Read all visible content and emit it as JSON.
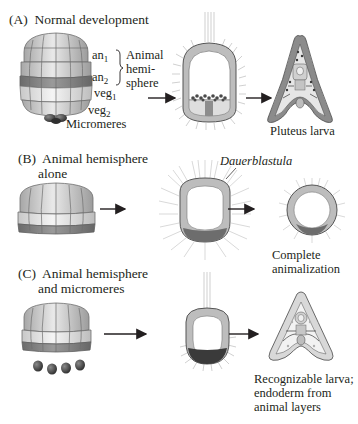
{
  "figure": {
    "panels": [
      {
        "id": "A",
        "title_letter": "(A)",
        "title": "Normal development",
        "tiers": {
          "an1": {
            "base": "an",
            "sub": "1"
          },
          "an2": {
            "base": "an",
            "sub": "2"
          },
          "veg1": {
            "base": "veg",
            "sub": "1"
          },
          "veg2": {
            "base": "veg",
            "sub": "2"
          },
          "micromeres": "Micromeres"
        },
        "bracket_label_lines": [
          "Animal",
          "hemi-",
          "sphere"
        ],
        "result_label": "Pluteus larva"
      },
      {
        "id": "B",
        "title_letter": "(B)",
        "title_lines": [
          "Animal hemisphere",
          "alone"
        ],
        "annotation": "Dauerblastula",
        "result_label_lines": [
          "Complete",
          "animalization"
        ]
      },
      {
        "id": "C",
        "title_letter": "(C)",
        "title_lines": [
          "Animal hemisphere",
          "and micromeres"
        ],
        "result_label_lines": [
          "Recognizable larva;",
          "endoderm from",
          "animal layers"
        ]
      }
    ],
    "colors": {
      "animal_cap_light": "#dcdcdc",
      "animal_outline": "#6f6f6f",
      "an2_band": "#8a8a8a",
      "veg1_light": "#eeeeee",
      "veg2_mid": "#b4b4b4",
      "micromere_dark": "#3f3f3f",
      "wall_gray": "#b9b9b9",
      "endoderm_dark": "#4a4a4a",
      "cilia": "#9a9a9a",
      "arrow": "#231f20",
      "text": "#231f20"
    }
  }
}
